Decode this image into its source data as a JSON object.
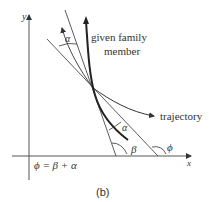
{
  "diagram": {
    "axes": {
      "x_label": "x",
      "y_label": "y"
    },
    "labels": {
      "family_member_line1": "given family",
      "family_member_line2": "member",
      "trajectory": "trajectory",
      "alpha_top": "α",
      "alpha_bottom": "α",
      "beta": "β",
      "phi": "ϕ",
      "equation": "ϕ = β + α"
    },
    "caption": "(b)"
  }
}
